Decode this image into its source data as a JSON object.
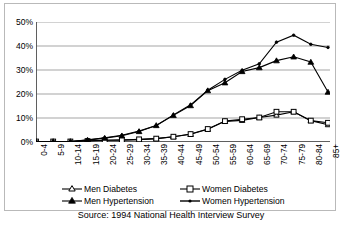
{
  "chart_data": {
    "type": "line",
    "title": "",
    "xlabel": "",
    "ylabel": "",
    "ylim": [
      0,
      50
    ],
    "yticks": [
      0,
      10,
      20,
      30,
      40,
      50
    ],
    "ytick_labels": [
      "0%",
      "10%",
      "20%",
      "30%",
      "40%",
      "50%"
    ],
    "grid": true,
    "legend_position": "bottom",
    "source_note": "Source: 1994 National Health Interview Survey",
    "categories": [
      "0-4",
      "5-9",
      "10-14",
      "15-19",
      "20-24",
      "25-29",
      "30-34",
      "35-39",
      "40-44",
      "45-49",
      "50-54",
      "55-59",
      "60-64",
      "65-69",
      "70-74",
      "75-79",
      "80-84",
      "85+"
    ],
    "series": [
      {
        "name": "Men Diabetes",
        "marker": "open-triangle",
        "values": [
          0.2,
          0.2,
          0.2,
          0.5,
          0.7,
          0.9,
          1.0,
          1.4,
          2.2,
          3.2,
          5.3,
          8.6,
          9.0,
          10.2,
          11.2,
          12.6,
          8.9,
          7.2
        ]
      },
      {
        "name": "Women Diabetes",
        "marker": "open-square",
        "values": [
          0.2,
          0.2,
          0.2,
          0.4,
          0.7,
          0.8,
          1.1,
          1.4,
          2.2,
          3.3,
          5.4,
          8.7,
          9.5,
          10.2,
          12.6,
          12.6,
          8.9,
          8.0
        ]
      },
      {
        "name": "Men Hypertension",
        "marker": "solid-triangle",
        "values": [
          0.2,
          0.2,
          0.2,
          0.8,
          1.6,
          2.6,
          4.4,
          6.9,
          11.1,
          15.2,
          21.4,
          24.7,
          29.4,
          31.0,
          33.9,
          35.5,
          33.3,
          20.8
        ]
      },
      {
        "name": "Women Hypertension",
        "marker": "solid-small",
        "values": [
          0.2,
          0.2,
          0.2,
          0.9,
          1.8,
          2.8,
          4.6,
          6.9,
          11.3,
          15.5,
          21.6,
          26.1,
          29.9,
          32.6,
          41.6,
          44.5,
          40.7,
          39.4
        ]
      }
    ]
  },
  "legend": {
    "items": [
      {
        "label": "Men Diabetes"
      },
      {
        "label": "Women Diabetes"
      },
      {
        "label": "Men Hypertension"
      },
      {
        "label": "Women Hypertension"
      }
    ]
  },
  "colors": {
    "line": "#000000",
    "grid": "#808080",
    "axis": "#4d4d4d",
    "background": "#ffffff",
    "border": "#b9b9b9"
  }
}
